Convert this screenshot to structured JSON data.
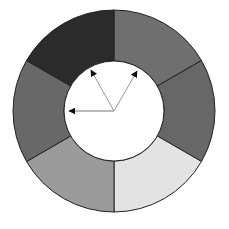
{
  "diagram": {
    "type": "segmented-ring",
    "center": [
      114,
      111
    ],
    "outer_radius": 101,
    "inner_radius": 50,
    "segments": [
      {
        "start_deg": 0,
        "end_deg": 60,
        "color": "#6f6f6f"
      },
      {
        "start_deg": 60,
        "end_deg": 120,
        "color": "#676767"
      },
      {
        "start_deg": 120,
        "end_deg": 180,
        "color": "#e3e3e3"
      },
      {
        "start_deg": 180,
        "end_deg": 240,
        "color": "#9b9b9b"
      },
      {
        "start_deg": 240,
        "end_deg": 300,
        "color": "#686868"
      },
      {
        "start_deg": 300,
        "end_deg": 360,
        "color": "#2b2b2b"
      }
    ],
    "arrows": [
      {
        "to": [
          91,
          70
        ],
        "color": "#999999"
      },
      {
        "to": [
          137,
          71
        ],
        "color": "#999999"
      },
      {
        "to": [
          69,
          111
        ],
        "color": "#777777"
      }
    ],
    "stroke_color": "#222222"
  }
}
